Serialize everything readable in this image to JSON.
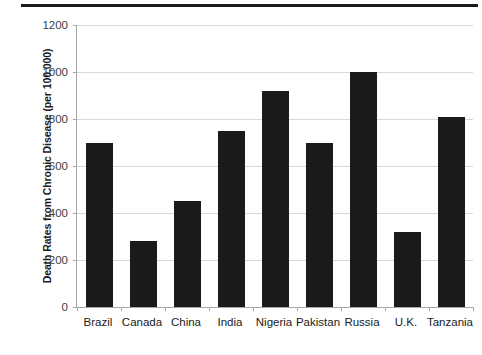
{
  "chart_data": {
    "type": "bar",
    "title": "",
    "xlabel": "",
    "ylabel": "Death Rates from Chronic Disease (per 100,000)",
    "categories": [
      "Brazil",
      "Canada",
      "China",
      "India",
      "Nigeria",
      "Pakistan",
      "Russia",
      "U.K.",
      "Tanzania"
    ],
    "values": [
      700,
      280,
      450,
      750,
      920,
      700,
      1000,
      320,
      810
    ],
    "ylim": [
      0,
      1200
    ],
    "yticks": [
      0,
      200,
      400,
      600,
      800,
      1000,
      1200
    ],
    "ytick_labels": [
      "0",
      "200",
      "400",
      "600",
      "800",
      "1000",
      "1200"
    ],
    "grid": "horizontal",
    "legend": "none",
    "bar_color": "#1a1a1a",
    "gridline_color": "#d9d9d9",
    "axis_color": "#a6a6a6",
    "text_color": "#1a1a1a"
  },
  "decorations": {
    "top_rule": "horizontal-rule"
  }
}
